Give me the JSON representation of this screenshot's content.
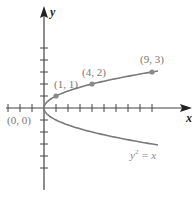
{
  "chart_data": {
    "type": "line",
    "title": "",
    "xlabel": "x",
    "ylabel": "y",
    "xlim": [
      -3,
      10
    ],
    "ylim": [
      -7,
      5
    ],
    "x_ticks_step": 1,
    "y_ticks_step": 1,
    "grid": false,
    "series": [
      {
        "name": "y^2 = x",
        "equation_label": "y",
        "equation_sup": "2",
        "equation_rest": " = x",
        "x_range": [
          0,
          9.5
        ],
        "points": [
          {
            "x": 0,
            "y": 0,
            "label": "(0, 0)"
          },
          {
            "x": 1,
            "y": 1,
            "label": "(1, 1)"
          },
          {
            "x": 4,
            "y": 2,
            "label": "(4, 2)"
          },
          {
            "x": 9,
            "y": 3,
            "label": "(9, 3)"
          }
        ]
      }
    ],
    "colors": {
      "curve": "#7a7a7a",
      "axis": "#444444",
      "labels": "#777777"
    }
  }
}
